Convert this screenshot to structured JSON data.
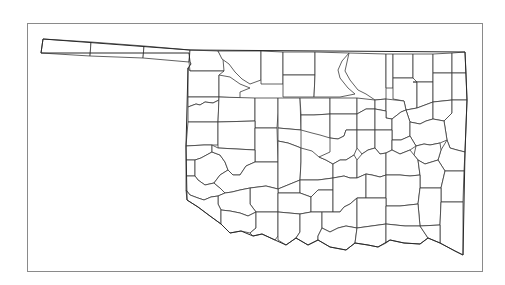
{
  "map": {
    "subject": "Oklahoma county boundaries",
    "frame": {
      "x": 27,
      "y": 23,
      "width": 456,
      "height": 249,
      "stroke": "#8a8a8a"
    },
    "colors": {
      "background": "#ffffff",
      "fill": "#ffffff",
      "stroke": "#3a3a3a"
    },
    "outline": "M43,39 L190,50 L465,52 L467,100 L465,152 L463,255 L455,251 L440,243 L428,238 L420,244 L404,243 L390,240 L378,247 L368,245 L355,243 L346,250 L330,247 L318,240 L308,245 L296,238 L286,245 L275,240 L262,234 L253,236 L241,231 L230,233 L221,224 L210,216 L198,207 L187,200 L186,146 L188,68 L191,64 L190,62 L189,53 L41,53 Z",
    "counties": [
      {
        "d": "M43,39 L91,42 L90,56 L41,53 Z"
      },
      {
        "d": "M91,42 L144,46 L143,58 L90,56 Z"
      },
      {
        "d": "M144,46 L190,50 L189,62 L143,58 Z"
      },
      {
        "d": "M190,50 L218,51 L223,59 L224,71 L190,71 L189,62 Z"
      },
      {
        "d": "M218,51 L261,51 L261,80 L250,84 L242,79 L235,72 L229,64 L222,59 Z"
      },
      {
        "d": "M190,71 L224,71 L219,75 L219,97 L188,97 L188,68 Z"
      },
      {
        "d": "M219,75 L230,77 L240,84 L250,88 L240,92 L240,98 L219,97 Z"
      },
      {
        "d": "M261,51 L283,52 L283,84 L261,84 Z"
      },
      {
        "d": "M283,52 L315,52 L315,75 L283,75 Z"
      },
      {
        "d": "M283,75 L315,75 L314,97 L283,97 L283,84 Z"
      },
      {
        "d": "M315,52 L349,53 L342,61 L338,70 L340,78 L348,88 L355,94 L340,97 L314,97 L315,75 Z"
      },
      {
        "d": "M349,53 L386,54 L386,99 L375,100 L366,94 L358,90 L350,80 L345,71 L347,62 Z"
      },
      {
        "d": "M386,54 L393,54 L393,88 L386,88 Z"
      },
      {
        "d": "M393,54 L413,54 L413,78 L393,78 Z"
      },
      {
        "d": "M413,54 L433,54 L433,82 L413,82 Z"
      },
      {
        "d": "M433,54 L452,53 L452,73 L433,73 Z"
      },
      {
        "d": "M452,53 L465,52 L466,73 L452,73 Z"
      },
      {
        "d": "M393,78 L413,78 L417,82 L417,108 L406,110 L404,101 L393,99 Z"
      },
      {
        "d": "M413,82 L433,82 L433,102 L417,108 L417,82 Z"
      },
      {
        "d": "M433,73 L452,73 L452,100 L433,102 Z"
      },
      {
        "d": "M452,73 L466,73 L467,100 L452,100 Z"
      },
      {
        "d": "M188,97 L219,97 L219,100 L213,103 L205,102 L200,105 L196,104 L188,107 Z"
      },
      {
        "d": "M188,107 L196,104 L200,105 L205,102 L213,103 L219,100 L218,122 L188,122 Z"
      },
      {
        "d": "M219,97 L255,98 L255,121 L218,122 Z"
      },
      {
        "d": "M255,98 L278,98 L278,113 L277,128 L255,128 L255,121 Z"
      },
      {
        "d": "M278,98 L300,98 L301,130 L278,128 Z"
      },
      {
        "d": "M300,98 L330,98 L330,114 L314,115 L301,115 Z"
      },
      {
        "d": "M330,98 L357,98 L357,114 L330,114 Z"
      },
      {
        "d": "M357,98 L375,100 L375,109 L366,109 L357,114 Z"
      },
      {
        "d": "M375,100 L386,99 L386,111 L375,109 Z"
      },
      {
        "d": "M386,99 L404,101 L406,110 L401,112 L392,119 L386,118 Z"
      },
      {
        "d": "M406,110 L417,108 L433,102 L433,119 L426,121 L420,124 L410,122 Z"
      },
      {
        "d": "M433,102 L452,100 L452,113 L444,121 L433,119 Z"
      },
      {
        "d": "M452,100 L467,100 L465,152 L457,150 L450,148 L447,140 L444,121 L452,113 Z"
      },
      {
        "d": "M188,122 L218,122 L218,145 L212,145 L204,145 L186,146 Z"
      },
      {
        "d": "M218,122 L255,121 L255,150 L218,148 Z"
      },
      {
        "d": "M255,128 L277,128 L278,162 L255,162 L255,150 Z"
      },
      {
        "d": "M278,128 L301,130 L301,148 L296,146 L288,143 L278,141 Z"
      },
      {
        "d": "M301,115 L314,115 L330,114 L330,138 L320,135 L312,133 L301,130 Z"
      },
      {
        "d": "M330,114 L357,114 L357,130 L346,130 L344,136 L338,139 L330,138 Z"
      },
      {
        "d": "M357,114 L366,109 L375,109 L375,130 L357,130 Z"
      },
      {
        "d": "M375,109 L386,111 L386,118 L392,119 L392,130 L375,130 Z"
      },
      {
        "d": "M392,119 L401,112 L406,110 L410,122 L410,136 L401,140 L392,140 Z"
      },
      {
        "d": "M410,122 L420,124 L426,121 L433,119 L444,121 L447,140 L440,143 L430,145 L424,144 L416,146 L410,136 Z"
      },
      {
        "d": "M447,140 L450,148 L457,150 L465,152 L464,171 L445,171 L438,160 L441,150 Z"
      },
      {
        "d": "M186,146 L204,145 L212,145 L212,152 L201,158 L195,160 L186,160 Z"
      },
      {
        "d": "M186,160 L195,160 L195,176 L186,176 Z"
      },
      {
        "d": "M195,160 L201,158 L212,152 L220,155 L225,162 L228,170 L220,175 L214,183 L205,185 L198,180 L195,176 Z"
      },
      {
        "d": "M212,145 L218,148 L255,150 L255,162 L246,166 L240,175 L233,175 L228,170 L225,162 L220,155 L212,152 Z"
      },
      {
        "d": "M186,176 L195,176 L198,180 L205,185 L214,183 L220,188 L225,193 L218,196 L211,197 L204,200 L198,198 L190,195 L186,190 Z"
      },
      {
        "d": "M228,170 L233,175 L240,175 L246,166 L255,162 L278,162 L278,189 L266,186 L250,188 L240,190 L232,192 L225,193 L220,188 L214,183 L220,175 Z"
      },
      {
        "d": "M278,141 L288,143 L296,146 L301,148 L301,162 L300,180 L278,189 L278,162 Z"
      },
      {
        "d": "M301,148 L312,151 L319,157 L326,160 L333,164 L333,178 L318,180 L300,180 L301,162 Z"
      },
      {
        "d": "M330,138 L338,139 L344,136 L346,130 L357,130 L357,148 L354,155 L346,160 L340,160 L333,164 L326,160 L319,157 L330,152 Z"
      },
      {
        "d": "M357,130 L375,130 L375,148 L368,150 L362,154 L357,148 Z"
      },
      {
        "d": "M375,130 L392,130 L392,140 L392,150 L386,153 L380,154 L375,148 Z"
      },
      {
        "d": "M392,140 L401,140 L410,136 L416,146 L410,150 L400,154 L392,150 Z"
      },
      {
        "d": "M416,146 L424,144 L430,145 L440,143 L441,150 L438,160 L425,164 L418,160 L414,155 Z"
      },
      {
        "d": "M333,164 L340,160 L346,160 L354,155 L357,160 L357,178 L350,178 L344,176 L333,178 Z"
      },
      {
        "d": "M357,160 L362,154 L368,150 L375,148 L380,154 L386,153 L386,175 L380,177 L372,175 L366,174 L357,178 Z"
      },
      {
        "d": "M386,153 L392,150 L400,154 L410,150 L414,155 L418,160 L420,175 L410,176 L400,175 L386,175 Z"
      },
      {
        "d": "M418,160 L425,164 L438,160 L445,171 L441,188 L420,188 L420,175 Z"
      },
      {
        "d": "M445,171 L464,171 L463,202 L441,202 L441,188 Z"
      },
      {
        "d": "M278,189 L300,180 L300,193 L278,193 Z"
      },
      {
        "d": "M300,180 L318,180 L333,178 L333,190 L318,190 L311,197 L300,193 Z"
      },
      {
        "d": "M250,188 L266,186 L278,189 L278,193 L278,212 L256,212 L250,204 Z"
      },
      {
        "d": "M225,193 L232,192 L240,190 L250,188 L250,204 L256,212 L248,216 L240,213 L230,211 L221,210 L218,204 L218,196 Z"
      },
      {
        "d": "M186,190 L190,195 L198,198 L204,200 L211,197 L218,196 L218,204 L221,210 L221,224 L210,216 L198,207 L187,200 Z"
      },
      {
        "d": "M278,193 L300,193 L311,197 L311,212 L300,214 L278,212 Z"
      },
      {
        "d": "M311,197 L318,190 L333,190 L333,212 L322,212 L311,212 Z"
      },
      {
        "d": "M333,178 L344,176 L350,178 L357,178 L366,174 L366,198 L357,198 L350,204 L344,207 L340,212 L333,212 Z"
      },
      {
        "d": "M366,174 L372,175 L380,177 L386,175 L386,198 L366,198 Z"
      },
      {
        "d": "M386,175 L400,175 L410,176 L420,175 L420,188 L418,204 L400,206 L386,206 Z"
      },
      {
        "d": "M420,188 L441,188 L441,202 L440,225 L420,226 L418,204 Z"
      },
      {
        "d": "M441,202 L463,202 L463,255 L455,251 L440,243 L440,225 Z"
      },
      {
        "d": "M221,210 L230,211 L240,213 L248,216 L256,212 L256,228 L250,233 L241,231 L230,233 L221,224 Z"
      },
      {
        "d": "M256,212 L278,212 L278,236 L275,240 L262,234 L253,236 L250,233 L256,228 Z"
      },
      {
        "d": "M278,212 L300,214 L300,232 L296,238 L286,245 L278,240 L278,236 Z"
      },
      {
        "d": "M300,214 L311,212 L322,212 L322,228 L318,236 L318,240 L308,245 L296,238 L300,232 Z"
      },
      {
        "d": "M322,212 L333,212 L340,212 L344,207 L350,204 L357,198 L357,228 L346,226 L338,228 L330,232 L322,228 Z"
      },
      {
        "d": "M330,232 L338,228 L346,226 L357,228 L355,243 L346,250 L330,247 L318,240 L318,236 L322,228 Z"
      },
      {
        "d": "M357,198 L366,198 L386,198 L386,206 L386,224 L357,228 Z"
      },
      {
        "d": "M386,206 L400,206 L418,204 L420,226 L405,226 L386,224 Z"
      },
      {
        "d": "M357,228 L386,224 L386,243 L378,247 L368,245 L355,243 Z"
      },
      {
        "d": "M386,224 L405,226 L420,226 L428,238 L420,244 L404,243 L390,240 L386,243 Z"
      },
      {
        "d": "M420,226 L440,225 L440,243 L428,238 Z"
      }
    ]
  }
}
